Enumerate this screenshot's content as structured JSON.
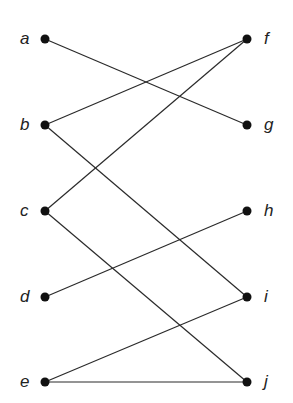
{
  "diagram": {
    "type": "bipartite-graph",
    "colors": {
      "node": "#111111",
      "edge": "#2a2a2a",
      "label": "#222222",
      "background": "#ffffff"
    },
    "left_nodes": [
      {
        "id": "a",
        "label": "a",
        "x": 45,
        "y": 39
      },
      {
        "id": "b",
        "label": "b",
        "x": 45,
        "y": 125
      },
      {
        "id": "c",
        "label": "c",
        "x": 45,
        "y": 211
      },
      {
        "id": "d",
        "label": "d",
        "x": 45,
        "y": 297
      },
      {
        "id": "e",
        "label": "e",
        "x": 45,
        "y": 382
      }
    ],
    "right_nodes": [
      {
        "id": "f",
        "label": "f",
        "x": 247,
        "y": 39
      },
      {
        "id": "g",
        "label": "g",
        "x": 247,
        "y": 125
      },
      {
        "id": "h",
        "label": "h",
        "x": 247,
        "y": 211
      },
      {
        "id": "i",
        "label": "i",
        "x": 247,
        "y": 297
      },
      {
        "id": "j",
        "label": "j",
        "x": 247,
        "y": 382
      }
    ],
    "edges": [
      [
        "a",
        "g"
      ],
      [
        "b",
        "f"
      ],
      [
        "b",
        "i"
      ],
      [
        "c",
        "f"
      ],
      [
        "c",
        "j"
      ],
      [
        "d",
        "h"
      ],
      [
        "e",
        "i"
      ],
      [
        "e",
        "j"
      ]
    ]
  }
}
